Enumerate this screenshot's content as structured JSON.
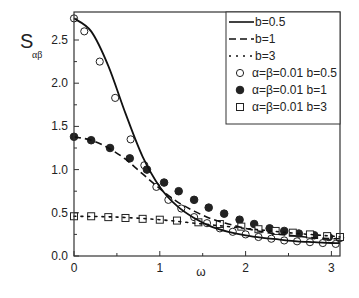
{
  "chart_data": {
    "type": "line",
    "title": "",
    "xlabel": "ω",
    "ylabel": "S_αβ",
    "ylabel_main": "S",
    "ylabel_sub": "αβ",
    "xlim": [
      0,
      3.1
    ],
    "ylim": [
      0,
      2.8
    ],
    "xticks": [
      "0",
      "1",
      "2",
      "3"
    ],
    "yticks": [
      "0.0",
      "0.5",
      "1.0",
      "1.5",
      "2.0",
      "2.5"
    ],
    "grid": false,
    "legend_position": "upper right",
    "series": [
      {
        "name": "b=0.5",
        "style": "solid-line",
        "x": [
          0,
          0.2,
          0.4,
          0.6,
          0.8,
          1.0,
          1.2,
          1.4,
          1.6,
          1.8,
          2.0,
          2.2,
          2.4,
          2.6,
          2.8,
          3.0,
          3.1
        ],
        "y": [
          2.75,
          2.6,
          2.2,
          1.65,
          1.15,
          0.8,
          0.58,
          0.44,
          0.34,
          0.28,
          0.24,
          0.21,
          0.19,
          0.17,
          0.16,
          0.15,
          0.15
        ]
      },
      {
        "name": "b=1",
        "style": "dashed-line",
        "x": [
          0,
          0.2,
          0.4,
          0.6,
          0.8,
          1.0,
          1.2,
          1.4,
          1.6,
          1.8,
          2.0,
          2.2,
          2.4,
          2.6,
          2.8,
          3.0,
          3.1
        ],
        "y": [
          1.38,
          1.34,
          1.25,
          1.12,
          0.95,
          0.78,
          0.63,
          0.52,
          0.43,
          0.37,
          0.32,
          0.28,
          0.25,
          0.23,
          0.21,
          0.2,
          0.2
        ]
      },
      {
        "name": "b=3",
        "style": "dotted-line",
        "x": [
          0,
          0.5,
          1.0,
          1.5,
          2.0,
          2.5,
          3.0,
          3.1
        ],
        "y": [
          0.46,
          0.45,
          0.42,
          0.37,
          0.32,
          0.27,
          0.23,
          0.22
        ]
      },
      {
        "name": "α=β=0.01 b=0.5",
        "style": "open-circle",
        "x": [
          0,
          0.12,
          0.3,
          0.48,
          0.66,
          0.82,
          0.96,
          1.1,
          1.25,
          1.4,
          1.55,
          1.7,
          1.85,
          2.0,
          2.15,
          2.3,
          2.45,
          2.6,
          2.75,
          2.9,
          3.05
        ],
        "y": [
          2.75,
          2.6,
          2.25,
          1.83,
          1.35,
          1.05,
          0.8,
          0.65,
          0.55,
          0.45,
          0.38,
          0.32,
          0.28,
          0.25,
          0.22,
          0.2,
          0.18,
          0.17,
          0.16,
          0.15,
          0.14
        ]
      },
      {
        "name": "α=β=0.01 b=1",
        "style": "filled-circle",
        "x": [
          0,
          0.2,
          0.42,
          0.65,
          0.85,
          1.05,
          1.22,
          1.4,
          1.57,
          1.75,
          1.93,
          2.1,
          2.28,
          2.45,
          2.62,
          2.8,
          2.97,
          3.1
        ],
        "y": [
          1.38,
          1.34,
          1.25,
          1.13,
          1.0,
          0.85,
          0.75,
          0.65,
          0.56,
          0.49,
          0.42,
          0.37,
          0.32,
          0.29,
          0.26,
          0.24,
          0.22,
          0.21
        ]
      },
      {
        "name": "α=β=0.01 b=3",
        "style": "open-square",
        "x": [
          0,
          0.2,
          0.4,
          0.6,
          0.8,
          1.0,
          1.2,
          1.45,
          1.7,
          1.95,
          2.15,
          2.35,
          2.55,
          2.75,
          2.95,
          3.1
        ],
        "y": [
          0.46,
          0.46,
          0.45,
          0.44,
          0.43,
          0.42,
          0.41,
          0.39,
          0.37,
          0.34,
          0.31,
          0.29,
          0.27,
          0.25,
          0.23,
          0.22
        ]
      }
    ]
  },
  "legend": {
    "items": [
      {
        "label": "b=0.5"
      },
      {
        "label": "b=1"
      },
      {
        "label": "b=3"
      },
      {
        "label": "α=β=0.01  b=0.5"
      },
      {
        "label": "α=β=0.01  b=1"
      },
      {
        "label": "α=β=0.01  b=3"
      }
    ]
  }
}
